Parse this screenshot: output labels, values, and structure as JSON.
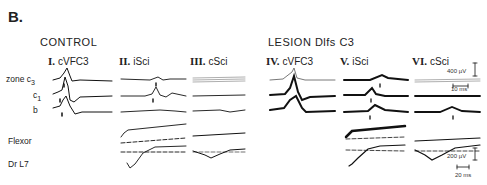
{
  "figure": {
    "panel_label": "B.",
    "groups": [
      {
        "label": "CONTROL"
      },
      {
        "label": "LESION Dlfs   C3"
      }
    ],
    "columns": [
      {
        "numeral": "I.",
        "label": "cVFC3"
      },
      {
        "numeral": "II.",
        "label": "iSci"
      },
      {
        "numeral": "III.",
        "label": "cSci"
      },
      {
        "numeral": "IV.",
        "label": "cVFC3"
      },
      {
        "numeral": "V.",
        "label": "iSci"
      },
      {
        "numeral": "VI.",
        "label": "cSci"
      }
    ],
    "row_labels": {
      "zone": "zone",
      "c3": "c",
      "c3_sub": "3",
      "c1": "c",
      "c1_sub": "1",
      "b": "b",
      "flexor": "Flexor",
      "drl7": "Dr L7"
    },
    "scale_bars": {
      "upper_voltage": "400 µV",
      "upper_time": "10 ms",
      "lower_voltage": "200 µV",
      "lower_time": "20 ms"
    }
  }
}
